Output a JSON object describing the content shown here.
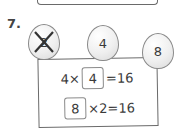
{
  "question_number": "7.",
  "balloons": [
    {
      "label": "2",
      "crossed_out": true
    },
    {
      "label": "4",
      "crossed_out": false
    },
    {
      "label": "8",
      "crossed_out": false
    }
  ],
  "equations": [
    {
      "left": "4×",
      "box": "4",
      "right": "=16"
    },
    {
      "box": "8",
      "right": "×2=16"
    }
  ]
}
